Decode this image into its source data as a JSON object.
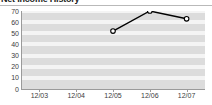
{
  "widget": {
    "title": "Net Income History",
    "background_color": "#ffffff",
    "rule_color": "#b9b9b9"
  },
  "chart_data": {
    "type": "line",
    "title": "Net Income History",
    "subtitle": "",
    "xlabel": "",
    "ylabel": "",
    "categories": [
      "12/03",
      "12/04",
      "12/05",
      "12/06",
      "12/07"
    ],
    "series": [
      {
        "name": "Net Income",
        "values": [
          null,
          null,
          52,
          70,
          63
        ],
        "line_color": "#000000",
        "marker_fill": "#ffffff",
        "marker_edge": "#000000"
      }
    ],
    "ylim": [
      0,
      70
    ],
    "yticks": [
      0,
      10,
      20,
      30,
      40,
      50,
      60,
      70
    ],
    "ytick_labels": [
      "0",
      "10",
      "20",
      "30",
      "40",
      "50",
      "60",
      "70"
    ],
    "xtick_labels": [
      "12/03",
      "12/04",
      "12/05",
      "12/06",
      "12/07"
    ],
    "grid": true,
    "grid_style": "horizontal-banded",
    "band_color": "#dcdcdc",
    "gridline_color": "#f4f4f4",
    "axis_color": "#9a9a9a",
    "legend": false,
    "legend_position": "none"
  }
}
